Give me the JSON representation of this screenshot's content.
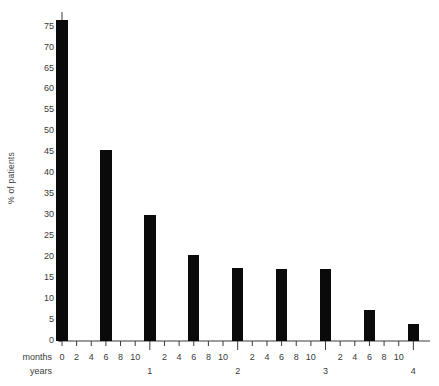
{
  "chart_data": {
    "type": "bar",
    "title": "",
    "subtitle": "",
    "xlabel": "months / years",
    "ylabel": "% of patients",
    "categories": [
      0,
      6,
      12,
      18,
      24,
      30,
      36,
      42,
      48
    ],
    "category_unit": "months",
    "values": [
      76.5,
      45.5,
      30.0,
      20.5,
      17.5,
      17.2,
      17.2,
      7.5,
      4.0
    ],
    "series": [
      {
        "name": "% of patients",
        "values": [
          76.5,
          45.5,
          30.0,
          20.5,
          17.5,
          17.2,
          17.2,
          7.5,
          4.0
        ]
      }
    ],
    "ylim": [
      0,
      78
    ],
    "xlim": [
      0,
      50
    ],
    "y_ticks": [
      0,
      5,
      10,
      15,
      20,
      25,
      30,
      35,
      40,
      45,
      50,
      55,
      60,
      65,
      70,
      75
    ],
    "y_tick_labels": [
      "0",
      "5",
      "10",
      "15",
      "20",
      "25",
      "30",
      "35",
      "40",
      "45",
      "50",
      "55",
      "60",
      "65",
      "70",
      "75"
    ],
    "x_month_ticks": [
      0,
      2,
      4,
      6,
      8,
      10,
      12,
      14,
      16,
      18,
      20,
      22,
      24,
      26,
      28,
      30,
      32,
      34,
      36,
      38,
      40,
      42,
      44,
      46,
      48
    ],
    "x_month_tick_labels": [
      "0",
      "2",
      "4",
      "6",
      "8",
      "10",
      "",
      "2",
      "4",
      "6",
      "8",
      "10",
      "",
      "2",
      "4",
      "6",
      "8",
      "10",
      "",
      "2",
      "4",
      "6",
      "8",
      "10",
      ""
    ],
    "x_year_ticks": [
      12,
      24,
      36,
      48
    ],
    "x_year_tick_labels": [
      "1",
      "2",
      "3",
      "4"
    ],
    "axis_row_labels": {
      "months": "months",
      "years": "years"
    },
    "grid": false,
    "legend": null,
    "bar_color": "#0a0a0a",
    "axis_color": "#3a3a3a",
    "bar_width_months": 1.55
  }
}
